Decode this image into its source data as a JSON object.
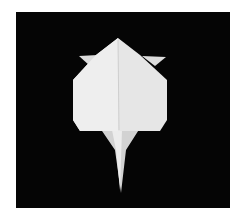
{
  "image": {
    "subject": "white origami figure on black background",
    "colors": {
      "background": "#ffffff",
      "photo_background": "#050505",
      "paper": "#e9e9e9",
      "paper_shade": "#cfcfcf"
    }
  }
}
